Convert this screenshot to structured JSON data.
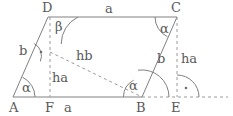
{
  "figure": {
    "kind": "geometry-diagram",
    "stroke_color": "#808080",
    "label_color": "#5a5a5a",
    "background": "#ffffff"
  },
  "vertices": [
    {
      "name": "A",
      "label": "A",
      "x": 13,
      "y": 97,
      "label_x": 9,
      "label_y": 101
    },
    {
      "name": "B",
      "label": "B",
      "x": 142,
      "y": 97,
      "label_x": 136,
      "label_y": 101
    },
    {
      "name": "C",
      "label": "C",
      "x": 177,
      "y": 17,
      "label_x": 171,
      "label_y": 1
    },
    {
      "name": "D",
      "label": "D",
      "x": 48,
      "y": 17,
      "label_x": 42,
      "label_y": 1
    },
    {
      "name": "F",
      "label": "F",
      "x": 50,
      "y": 97,
      "label_x": 45,
      "label_y": 101
    },
    {
      "name": "E",
      "label": "E",
      "x": 177,
      "y": 97,
      "label_x": 171,
      "label_y": 101
    }
  ],
  "solid_edges": [
    {
      "name": "edge-AB",
      "from": "A",
      "to": "B"
    },
    {
      "name": "edge-AD",
      "from": "A",
      "to": "D"
    },
    {
      "name": "edge-DC",
      "from": "D",
      "to": "C"
    },
    {
      "name": "edge-CB",
      "from": "C",
      "to": "B"
    }
  ],
  "dashed_edges": [
    {
      "name": "height-ha-DF",
      "x1": 50,
      "y1": 17,
      "x2": 50,
      "y2": 97
    },
    {
      "name": "height-ha-CE",
      "x1": 177,
      "y1": 17,
      "x2": 177,
      "y2": 97
    },
    {
      "name": "height-hb",
      "x1": 50,
      "y1": 52,
      "x2": 142,
      "y2": 97
    },
    {
      "name": "baseline-extension",
      "x1": 142,
      "y1": 97,
      "x2": 228,
      "y2": 97
    }
  ],
  "side_labels": [
    {
      "name": "label-a-top",
      "text": "a",
      "x": 105,
      "y": 2
    },
    {
      "name": "label-a-bottom",
      "text": "a",
      "x": 64,
      "y": 101
    },
    {
      "name": "label-b-left",
      "text": "b",
      "x": 19,
      "y": 44
    },
    {
      "name": "label-b-right",
      "text": "b",
      "x": 157,
      "y": 52
    },
    {
      "name": "label-ha-left",
      "text": "ha",
      "x": 52,
      "y": 71
    },
    {
      "name": "label-ha-right",
      "text": "ha",
      "x": 181,
      "y": 52
    },
    {
      "name": "label-hb",
      "text": "hb",
      "x": 76,
      "y": 49
    }
  ],
  "angle_labels": [
    {
      "name": "angle-alpha-at-A",
      "text": "α",
      "x": 22,
      "y": 81
    },
    {
      "name": "angle-beta-at-D",
      "text": "β",
      "x": 55,
      "y": 20
    },
    {
      "name": "angle-alpha-at-C",
      "text": "α",
      "x": 160,
      "y": 22
    },
    {
      "name": "angle-alpha-at-B",
      "text": "α",
      "x": 129,
      "y": 79
    }
  ],
  "angle_arcs": [
    {
      "name": "arc-alpha-at-A",
      "vertex": "A",
      "radius": 22
    },
    {
      "name": "arc-beta-at-D",
      "vertex": "D",
      "radius": 30
    },
    {
      "name": "arc-alpha-at-C",
      "vertex": "C",
      "radius": 22
    },
    {
      "name": "arc-alpha-at-B-interior",
      "vertex": "B",
      "radius": 19
    },
    {
      "name": "arc-alpha-at-B-outer",
      "vertex": "B",
      "radius": 27
    },
    {
      "name": "arc-right-angle-at-E",
      "vertex": "E",
      "radius": 22
    },
    {
      "name": "arc-right-angle-on-AD",
      "vertex": "foot-of-hb",
      "radius": 14
    }
  ],
  "right_angle_marks": [
    {
      "name": "right-angle-dot-at-E",
      "x": 174,
      "y": 88
    },
    {
      "name": "right-angle-dot-on-AD",
      "x": 40,
      "y": 52
    }
  ]
}
